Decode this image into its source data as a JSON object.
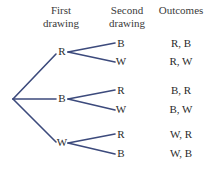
{
  "figure": {
    "kind": "probability-tree-diagram",
    "background_color": "#ffffff",
    "line_color": "#3c4a7c",
    "text_color": "#2b2b2b"
  },
  "headers": {
    "first": {
      "line1": "First",
      "line2": "drawing"
    },
    "second": {
      "line1": "Second",
      "line2": "drawing"
    },
    "outcomes": {
      "line1": "Outcomes",
      "line2": ""
    }
  },
  "tree": {
    "root": {
      "x": 13,
      "y": 99
    },
    "level1": [
      {
        "label": "R",
        "x": 62,
        "y": 52
      },
      {
        "label": "B",
        "x": 62,
        "y": 99
      },
      {
        "label": "W",
        "x": 62,
        "y": 143
      }
    ],
    "level2": [
      {
        "label": "B",
        "x": 121,
        "y": 44,
        "parent": 0
      },
      {
        "label": "W",
        "x": 121,
        "y": 62,
        "parent": 0
      },
      {
        "label": "R",
        "x": 121,
        "y": 91,
        "parent": 1
      },
      {
        "label": "W",
        "x": 121,
        "y": 110,
        "parent": 1
      },
      {
        "label": "R",
        "x": 121,
        "y": 135,
        "parent": 2
      },
      {
        "label": "B",
        "x": 121,
        "y": 154,
        "parent": 2
      }
    ]
  },
  "outcomes": [
    {
      "text": "R, B",
      "y": 44
    },
    {
      "text": "R, W",
      "y": 62
    },
    {
      "text": "B, R",
      "y": 91
    },
    {
      "text": "B, W",
      "y": 110
    },
    {
      "text": "W, R",
      "y": 135
    },
    {
      "text": "W, B",
      "y": 154
    }
  ]
}
